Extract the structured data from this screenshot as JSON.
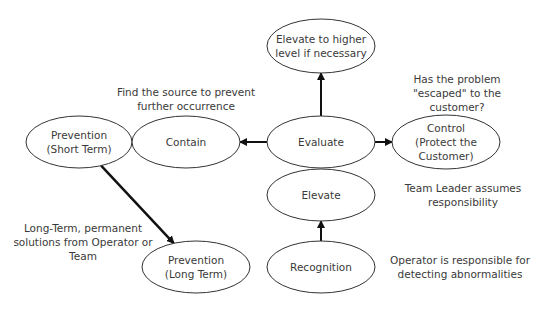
{
  "diagram": {
    "type": "flow",
    "nodes": [
      {
        "id": "elevate_higher",
        "lines": [
          "Elevate to higher",
          "level if necessary"
        ],
        "cx": 321,
        "cy": 46,
        "rx": 54,
        "ry": 27
      },
      {
        "id": "prevention_short",
        "lines": [
          "Prevention",
          "(Short Term)"
        ],
        "cx": 79,
        "cy": 142,
        "rx": 53,
        "ry": 26
      },
      {
        "id": "contain",
        "lines": [
          "Contain"
        ],
        "cx": 186,
        "cy": 142,
        "rx": 54,
        "ry": 26
      },
      {
        "id": "evaluate",
        "lines": [
          "Evaluate"
        ],
        "cx": 321,
        "cy": 142,
        "rx": 54,
        "ry": 26
      },
      {
        "id": "control",
        "lines": [
          "Control",
          "(Protect the",
          "Customer)"
        ],
        "cx": 446,
        "cy": 142,
        "rx": 54,
        "ry": 27
      },
      {
        "id": "elevate",
        "lines": [
          "Elevate"
        ],
        "cx": 321,
        "cy": 195,
        "rx": 54,
        "ry": 26
      },
      {
        "id": "prevention_long",
        "lines": [
          "Prevention",
          "(Long Term)"
        ],
        "cx": 196,
        "cy": 267,
        "rx": 54,
        "ry": 26
      },
      {
        "id": "recognition",
        "lines": [
          "Recognition"
        ],
        "cx": 321,
        "cy": 267,
        "rx": 54,
        "ry": 26
      }
    ],
    "edges": [
      {
        "from": "recognition",
        "to": "elevate"
      },
      {
        "from": "evaluate",
        "to": "elevate_higher"
      },
      {
        "from": "evaluate",
        "to": "contain"
      },
      {
        "from": "evaluate",
        "to": "control"
      },
      {
        "from": "prevention_short",
        "to": "prevention_long",
        "thick": true
      }
    ],
    "notes": [
      {
        "id": "note_contain",
        "lines": [
          "Find the source to prevent",
          "further occurrence"
        ],
        "x": 186,
        "y": 96
      },
      {
        "id": "note_control",
        "lines": [
          "Has the problem",
          "\"escaped\" to the",
          "customer?"
        ],
        "x": 457,
        "y": 83
      },
      {
        "id": "note_team_leader",
        "lines": [
          "Team Leader assumes",
          "responsibility"
        ],
        "x": 463,
        "y": 192
      },
      {
        "id": "note_long_term",
        "lines": [
          "Long-Term, permanent",
          "solutions from Operator or",
          "Team"
        ],
        "x": 83,
        "y": 232
      },
      {
        "id": "note_operator",
        "lines": [
          "Operator is responsible for",
          "detecting abnormalities"
        ],
        "x": 460,
        "y": 264
      }
    ]
  }
}
